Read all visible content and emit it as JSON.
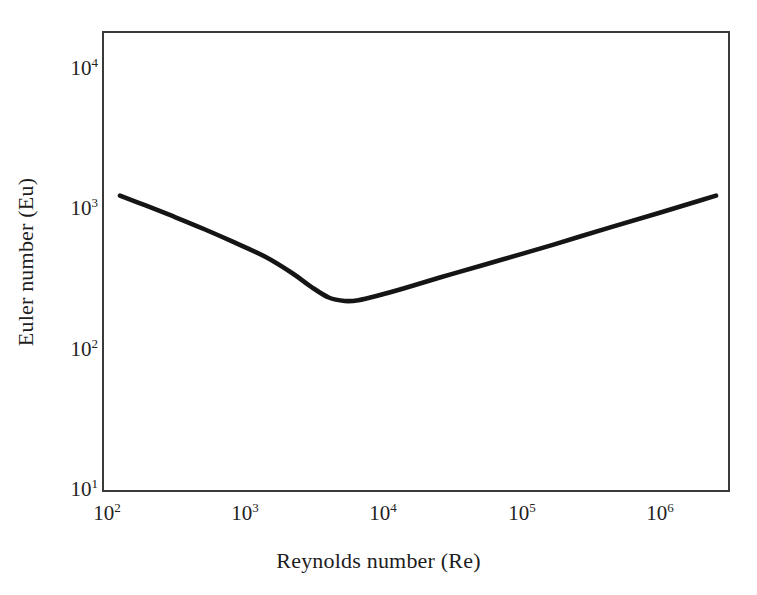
{
  "figure": {
    "background_color": "#ffffff",
    "frame_color": "#3a3a3a",
    "curve_color": "#151515"
  },
  "chart_data": {
    "type": "line",
    "title": "",
    "subtitle": "",
    "xlabel": "Reynolds number (Re)",
    "ylabel": "Euler number (Eu)",
    "xscale": "log",
    "yscale": "log",
    "xlim": [
      100,
      2800000
    ],
    "ylim": [
      10,
      18000
    ],
    "grid": false,
    "legend": null,
    "xticks": [
      {
        "value": 100,
        "label": "10",
        "exponent": "2"
      },
      {
        "value": 1000,
        "label": "10",
        "exponent": "3"
      },
      {
        "value": 10000,
        "label": "10",
        "exponent": "4"
      },
      {
        "value": 100000,
        "label": "10",
        "exponent": "5"
      },
      {
        "value": 1000000,
        "label": "10",
        "exponent": "6"
      }
    ],
    "yticks": [
      {
        "value": 10,
        "label": "10",
        "exponent": "1"
      },
      {
        "value": 100,
        "label": "10",
        "exponent": "2"
      },
      {
        "value": 1000,
        "label": "10",
        "exponent": "3"
      },
      {
        "value": 10000,
        "label": "10",
        "exponent": "4"
      }
    ],
    "series": [
      {
        "name": "Euler number curve",
        "x": [
          130,
          200,
          320,
          520,
          850,
          1400,
          2200,
          3000,
          4000,
          5200,
          6500,
          9000,
          14000,
          30000,
          70000,
          160000,
          400000,
          900000,
          1700000,
          2300000
        ],
        "y": [
          1250,
          1060,
          880,
          720,
          580,
          460,
          350,
          280,
          235,
          222,
          225,
          243,
          275,
          345,
          440,
          560,
          740,
          940,
          1140,
          1250
        ]
      }
    ],
    "annotations": [
      {
        "text": "minimum",
        "x": 5000,
        "y": 222
      }
    ]
  },
  "axes": {
    "x_title": "Reynolds number (Re)",
    "y_title": "Euler number (Eu)"
  }
}
